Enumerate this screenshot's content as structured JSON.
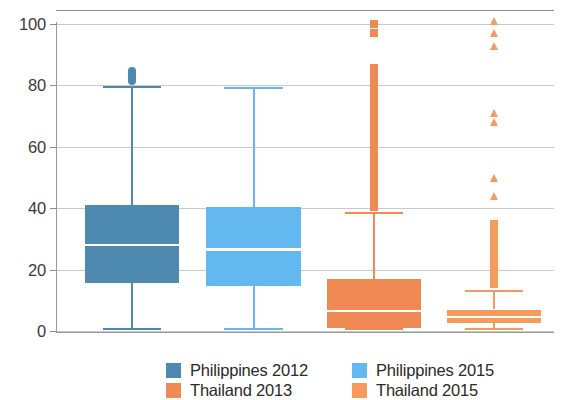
{
  "chart_data": {
    "type": "box",
    "title": "",
    "xlabel": "",
    "ylabel": "",
    "ylim": [
      0,
      105
    ],
    "yticks": [
      0,
      20,
      40,
      60,
      80,
      100
    ],
    "ytick_labels": [
      "0",
      "20",
      "40",
      "60",
      "80",
      "100"
    ],
    "grid": "horizontal",
    "legend_position": "bottom",
    "categories": [
      "Philippines 2012",
      "Philippines 2015",
      "Thailand 2013",
      "Thailand 2015"
    ],
    "series": [
      {
        "name": "Philippines 2012",
        "color": "#4e89b0",
        "whisker_low": 0.5,
        "q1": 15.5,
        "median": 28,
        "q3": 41,
        "whisker_high": 79.5,
        "outliers": [
          80,
          81,
          82,
          83,
          84,
          85,
          86
        ]
      },
      {
        "name": "Philippines 2015",
        "color": "#62b8ef",
        "whisker_low": 0.7,
        "q1": 14.5,
        "median": 26.5,
        "q3": 40.5,
        "whisker_high": 79,
        "outliers": []
      },
      {
        "name": "Thailand 2013",
        "color": "#f08a54",
        "whisker_low": 0.5,
        "q1": 1,
        "median": 6.5,
        "q3": 17,
        "whisker_high": 38.5,
        "outliers": [
          39,
          45,
          52,
          58,
          64,
          70,
          76,
          82,
          87,
          97,
          100
        ]
      },
      {
        "name": "Thailand 2015",
        "color": "#f79a5e",
        "whisker_low": 0.5,
        "q1": 2.5,
        "median": 4.5,
        "q3": 7,
        "whisker_high": 13,
        "outliers": [
          14,
          18,
          22,
          26,
          30,
          33,
          36,
          43,
          49,
          67,
          70,
          92,
          96,
          100
        ]
      }
    ]
  },
  "legend": {
    "items": [
      {
        "label": "Philippines 2012",
        "color": "#4e89b0"
      },
      {
        "label": "Philippines 2015",
        "color": "#62b8ef"
      },
      {
        "label": "Thailand 2013",
        "color": "#f08a54"
      },
      {
        "label": "Thailand 2015",
        "color": "#f79a5e"
      }
    ]
  }
}
